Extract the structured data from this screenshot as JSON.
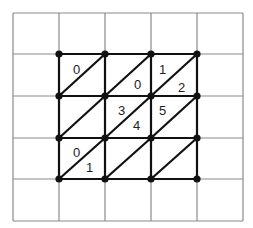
{
  "diagram": {
    "grid": {
      "x_lines": [
        13,
        59,
        105,
        151,
        197,
        243
      ],
      "y_lines": [
        13,
        54,
        96,
        138,
        179,
        221
      ],
      "color": "#8a8a8a"
    },
    "mesh": {
      "color": "#111111",
      "vertices": [
        [
          59,
          54
        ],
        [
          105,
          54
        ],
        [
          151,
          54
        ],
        [
          197,
          54
        ],
        [
          59,
          96
        ],
        [
          105,
          96
        ],
        [
          151,
          96
        ],
        [
          197,
          96
        ],
        [
          59,
          138
        ],
        [
          105,
          138
        ],
        [
          151,
          138
        ],
        [
          197,
          138
        ],
        [
          59,
          179
        ],
        [
          105,
          179
        ],
        [
          151,
          179
        ],
        [
          197,
          179
        ]
      ],
      "diagonals": [
        [
          59,
          96,
          105,
          54
        ],
        [
          105,
          96,
          151,
          54
        ],
        [
          151,
          96,
          197,
          54
        ],
        [
          59,
          138,
          105,
          96
        ],
        [
          105,
          138,
          151,
          96
        ],
        [
          151,
          138,
          197,
          96
        ],
        [
          59,
          179,
          105,
          138
        ],
        [
          105,
          179,
          151,
          138
        ],
        [
          151,
          179,
          197,
          138
        ]
      ]
    },
    "labels": [
      {
        "text": "0",
        "x": 73,
        "y": 74
      },
      {
        "text": "0",
        "x": 134,
        "y": 89
      },
      {
        "text": "1",
        "x": 159,
        "y": 74
      },
      {
        "text": "2",
        "x": 178,
        "y": 92
      },
      {
        "text": "3",
        "x": 118,
        "y": 115
      },
      {
        "text": "4",
        "x": 133,
        "y": 130
      },
      {
        "text": "5",
        "x": 159,
        "y": 115
      },
      {
        "text": "0",
        "x": 73,
        "y": 157
      },
      {
        "text": "1",
        "x": 86,
        "y": 172
      }
    ]
  }
}
